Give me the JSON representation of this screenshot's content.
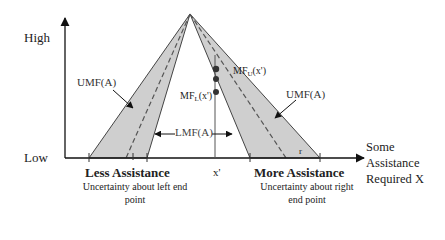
{
  "diagram": {
    "axes": {
      "y_high": "High",
      "y_low": "Low",
      "x_label_lines": [
        "Some",
        "Assistance",
        "Required X"
      ]
    },
    "annotations": {
      "umf_left": "UMF(A)",
      "umf_right": "UMF(A)",
      "lmf": "LMF(A)",
      "mf_upper_base": "MF",
      "mf_upper_sub": "U",
      "mf_upper_arg": "(x')",
      "mf_lower_base": "MF",
      "mf_lower_sub": "L",
      "mf_lower_arg": "(x')",
      "x_prime": "x'",
      "r_mark": "r"
    },
    "captions": {
      "left_title": "Less Assistance",
      "left_sub": "Uncertainty about left end point",
      "right_title": "More Assistance",
      "right_sub": "Uncertainty about right end point"
    },
    "colors": {
      "fou_fill": "#cfcfcf",
      "line": "#333333",
      "background": "#ffffff"
    }
  }
}
